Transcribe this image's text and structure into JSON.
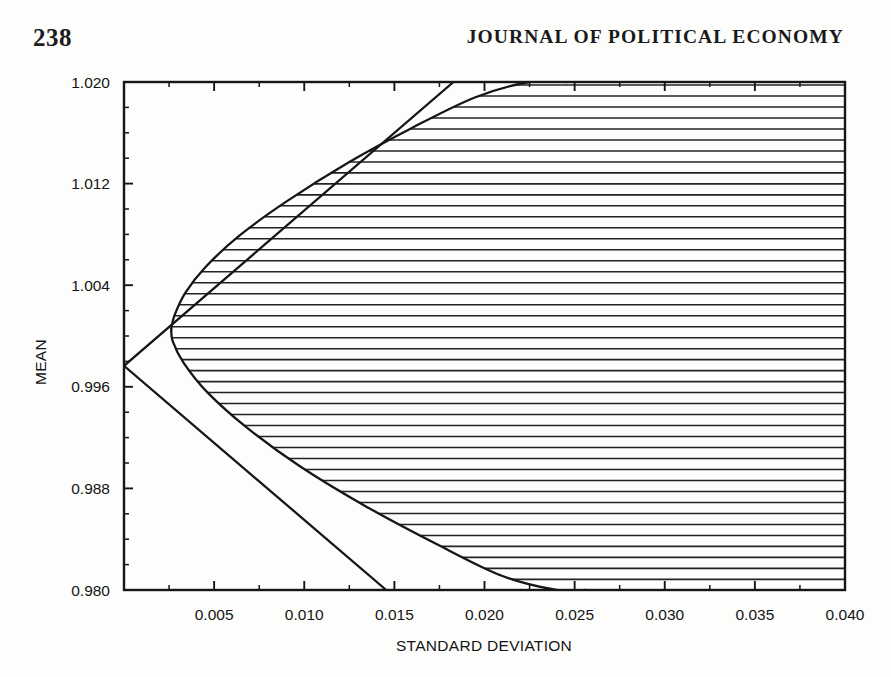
{
  "page": {
    "folio": "238",
    "running_head": "JOURNAL OF POLITICAL ECONOMY",
    "background_color": "#fdfdfc",
    "ink_color": "#161616"
  },
  "chart_data": {
    "type": "line",
    "title": "",
    "xlabel": "STANDARD DEVIATION",
    "ylabel": "MEAN",
    "xlim": [
      0.0,
      0.04
    ],
    "ylim": [
      0.98,
      1.02
    ],
    "grid": false,
    "legend": "none",
    "xticks": [
      0.005,
      0.01,
      0.015,
      0.02,
      0.025,
      0.03,
      0.035,
      0.04
    ],
    "xticklabels": [
      "0.005",
      "0.010",
      "0.015",
      "0.020",
      "0.025",
      "0.030",
      "0.035",
      "0.040"
    ],
    "xtick_minor_step": 0.0025,
    "yticks": [
      0.98,
      0.988,
      0.996,
      1.004,
      1.012,
      1.02
    ],
    "yticklabels": [
      "0.980",
      "0.988",
      "0.996",
      "1.004",
      "1.012",
      "1.020"
    ],
    "ytick_minor_step": 0.002,
    "shading": {
      "style": "horizontal-hatch",
      "description": "feasible set bounded by mean-variance frontier",
      "line_spacing_data_units": 0.000865,
      "line_count": 47
    },
    "series": [
      {
        "name": "upper-ray",
        "role": "riskless-rate tangency ray (upper)",
        "kind": "straight-line",
        "points": [
          [
            0.0,
            0.99765
          ],
          [
            0.01828,
            1.02
          ]
        ]
      },
      {
        "name": "lower-ray",
        "role": "riskless-rate tangency ray (lower)",
        "kind": "straight-line",
        "points": [
          [
            0.0,
            0.99765
          ],
          [
            0.01455,
            0.98
          ]
        ]
      },
      {
        "name": "frontier-upper",
        "role": "efficient frontier (upper branch of hyperbola)",
        "kind": "curve",
        "points": [
          [
            0.00262,
            1.00055
          ],
          [
            0.0028,
            1.00162
          ],
          [
            0.0034,
            1.0034
          ],
          [
            0.0045,
            1.0054
          ],
          [
            0.0064,
            1.0079
          ],
          [
            0.009,
            1.01058
          ],
          [
            0.0125,
            1.0137
          ],
          [
            0.016,
            1.0164
          ],
          [
            0.0195,
            1.0188
          ],
          [
            0.0225,
            1.02
          ],
          [
            0.02455,
            1.02
          ]
        ]
      },
      {
        "name": "frontier-lower",
        "role": "inefficient frontier (lower branch of hyperbola)",
        "kind": "curve",
        "points": [
          [
            0.00262,
            1.00055
          ],
          [
            0.0027,
            0.9996
          ],
          [
            0.0033,
            0.9979
          ],
          [
            0.0046,
            0.9956
          ],
          [
            0.0068,
            0.9928
          ],
          [
            0.0098,
            0.9897
          ],
          [
            0.0134,
            0.9866
          ],
          [
            0.0175,
            0.9835
          ],
          [
            0.021,
            0.9811
          ],
          [
            0.024,
            0.98
          ],
          [
            0.0256,
            0.98
          ]
        ]
      }
    ],
    "annotations": [
      {
        "label": "ray vertex (riskless asset)",
        "x": 0.0,
        "y": 0.99765
      },
      {
        "label": "minimum-variance point",
        "x": 0.00262,
        "y": 1.00055
      }
    ]
  },
  "axes": {
    "x_title": "STANDARD DEVIATION",
    "y_title": "MEAN"
  }
}
